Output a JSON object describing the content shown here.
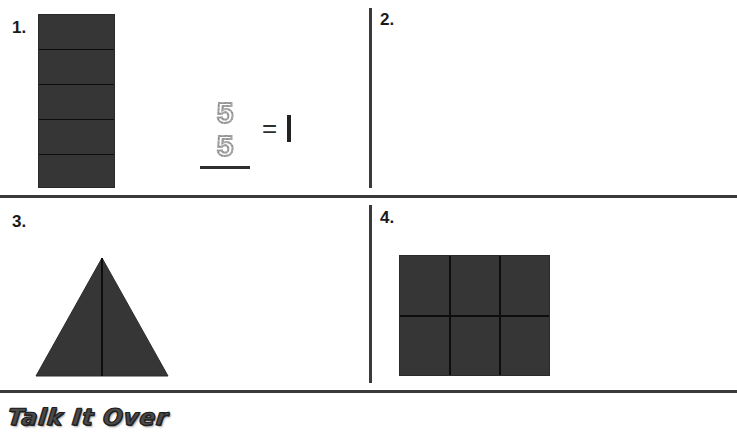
{
  "worksheet": {
    "banner_label": "Talk It Over",
    "equals_symbol": "=",
    "whole_value": "1",
    "shape_fill_color": "#363636",
    "rule_color": "#3a3a3a",
    "traced_digit_color": "#8a8a8a"
  },
  "problems": [
    {
      "number": "1.",
      "shape": "rectangle",
      "parts": 5,
      "orientation": "horizontal-bands",
      "numerator": "5",
      "denominator": "5",
      "numerator_style": "dotted-trace",
      "denominator_style": "dotted-trace",
      "equals": "=",
      "result": "1"
    },
    {
      "number": "2.",
      "shape": "circle",
      "parts": 3,
      "orientation": "three-radii",
      "numerator": "",
      "denominator": "",
      "numerator_style": "blank",
      "denominator_style": "blank",
      "equals": "=",
      "result": "1"
    },
    {
      "number": "3.",
      "shape": "triangle",
      "parts": 2,
      "orientation": "vertical-split",
      "numerator": "",
      "denominator": "",
      "numerator_style": "blank",
      "denominator_style": "blank",
      "equals": "=",
      "result": "1"
    },
    {
      "number": "4.",
      "shape": "square",
      "parts": 6,
      "orientation": "grid-3x2",
      "numerator": "",
      "denominator": "",
      "numerator_style": "blank",
      "denominator_style": "blank",
      "equals": "=",
      "result": "1"
    }
  ]
}
